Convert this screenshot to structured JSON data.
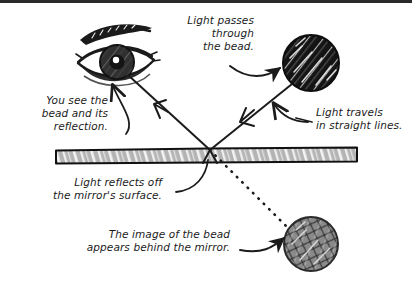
{
  "figure": {
    "background_color": "#ffffff",
    "ink_color": "#1b1b1b",
    "top_strip_color": "#2a2a2a"
  },
  "labels": {
    "light_passes": {
      "text": "Light passes\nthrough\nthe bead.",
      "align": "right"
    },
    "you_see": {
      "text": "You see the\nbead and its\nreflection.",
      "align": "right"
    },
    "light_travels": {
      "text": "Light travels\nin straight lines.",
      "align": "left"
    },
    "light_reflects": {
      "text": "Light reflects off\nthe mirror's surface.",
      "align": "right"
    },
    "image_behind": {
      "text": "The image of the bead\nappears behind the mirror.",
      "align": "right"
    }
  },
  "objects": {
    "eye": {
      "name": "eye",
      "color": "#1b1b1b",
      "iris_color": "#3b3b3b"
    },
    "real_bead": {
      "name": "bead",
      "fill": "#141414",
      "highlight": "#f2f2f2"
    },
    "virtual_bead": {
      "name": "image-of-bead",
      "fill": "#8a8a8a",
      "mesh": "#2e2e2e",
      "highlight": "#e8e8e8"
    },
    "mirror": {
      "name": "mirror",
      "fill": "#b4b4b4",
      "stroke": "#111111",
      "streak": "#f0f0f0"
    }
  },
  "rays": {
    "incident": {
      "label": "incident-ray",
      "style": "solid",
      "direction": "bead-to-mirror"
    },
    "reflected": {
      "label": "reflected-ray",
      "style": "solid",
      "direction": "mirror-to-eye"
    },
    "virtual": {
      "label": "virtual-ray",
      "style": "dotted",
      "direction": "mirror-to-image"
    }
  }
}
